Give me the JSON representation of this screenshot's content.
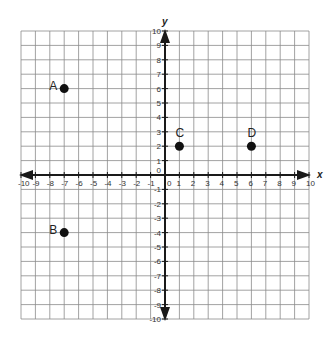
{
  "chart_data": {
    "type": "scatter",
    "title": "",
    "xlabel": "x",
    "ylabel": "y",
    "xlim": [
      -10,
      10
    ],
    "ylim": [
      -10,
      10
    ],
    "grid": true,
    "x_ticks": [
      -10,
      -9,
      -8,
      -7,
      -6,
      -5,
      -4,
      -3,
      -2,
      -1,
      0,
      1,
      2,
      3,
      4,
      5,
      6,
      7,
      8,
      9,
      10
    ],
    "y_ticks": [
      -10,
      -9,
      -8,
      -7,
      -6,
      -5,
      -4,
      -3,
      -2,
      -1,
      0,
      1,
      2,
      3,
      4,
      5,
      6,
      7,
      8,
      9,
      10
    ],
    "points": [
      {
        "label": "A",
        "x": -7,
        "y": 6
      },
      {
        "label": "B",
        "x": -7,
        "y": -4
      },
      {
        "label": "C",
        "x": 1,
        "y": 2
      },
      {
        "label": "D",
        "x": 6,
        "y": 2
      }
    ],
    "legend": null
  },
  "layout": {
    "grid_left": 21,
    "grid_top": 31,
    "cell": 14.4,
    "colors": {
      "grid": "#8a8a8a",
      "axis": "#1a1a1a",
      "point": "#111111"
    }
  }
}
